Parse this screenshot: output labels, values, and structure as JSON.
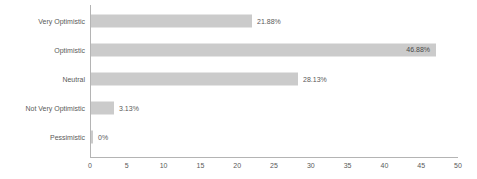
{
  "chart_data": {
    "type": "bar",
    "orientation": "horizontal",
    "title": "",
    "subtitle": "",
    "xlabel": "",
    "ylabel": "",
    "categories": [
      "Very Optimistic",
      "Optimistic",
      "Neutral",
      "Not Very Optimistic",
      "Pessimistic"
    ],
    "values": [
      21.88,
      46.88,
      28.13,
      3.13,
      0
    ],
    "data_labels": [
      "21.88%",
      "46.88%",
      "28.13%",
      "3.13%",
      "0%"
    ],
    "label_placement": [
      "outside",
      "inside",
      "outside",
      "outside",
      "outside"
    ],
    "xlim": [
      0,
      50
    ],
    "x_ticks": [
      0,
      5,
      10,
      15,
      20,
      25,
      30,
      35,
      40,
      45,
      50
    ],
    "x_tick_labels": [
      "0",
      "5",
      "10",
      "15",
      "20",
      "25",
      "30",
      "35",
      "40",
      "45",
      "50"
    ],
    "grid": false,
    "legend": false,
    "legend_position": "none",
    "colors": {
      "bar_fill": "#cbcbcb",
      "axis_line": "#b4b4b4",
      "tick_text": "#5a5a5a",
      "label_text": "#5a5a5a",
      "inside_label_text": "#4a4a4a",
      "background": "#ffffff"
    }
  }
}
